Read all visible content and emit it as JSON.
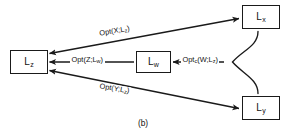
{
  "figure": {
    "caption": "(b)",
    "width": 286,
    "height": 131,
    "ink_color": "#1a1a1a",
    "background_color": "#ffffff"
  },
  "nodes": [
    {
      "id": "Lz",
      "base": "L",
      "sub": "z",
      "x": 10,
      "y": 50,
      "w": 38,
      "h": 24
    },
    {
      "id": "Lw",
      "base": "L",
      "sub": "w",
      "x": 136,
      "y": 51,
      "w": 35,
      "h": 22
    },
    {
      "id": "Lx",
      "base": "L",
      "sub": "x",
      "x": 242,
      "y": 5,
      "w": 38,
      "h": 24
    },
    {
      "id": "Ly",
      "base": "L",
      "sub": "y",
      "x": 242,
      "y": 96,
      "w": 38,
      "h": 24
    }
  ],
  "edge_labels": [
    {
      "id": "opt-x-lz",
      "prefix": "Opt",
      "csub": "",
      "args": "(X;L",
      "argsub": "z",
      "close": ")",
      "x": 98,
      "y": 30,
      "rotate": "up"
    },
    {
      "id": "opt-z-lw",
      "prefix": "Opt",
      "csub": "",
      "args": "(Z;L",
      "argsub": "w",
      "close": ")",
      "x": 70,
      "y": 56,
      "rotate": "none"
    },
    {
      "id": "opt-c-w-lz",
      "prefix": "Opt",
      "csub": "c",
      "args": "(W;L",
      "argsub": "z",
      "close": ")",
      "x": 181,
      "y": 56,
      "rotate": "none"
    },
    {
      "id": "opt-y-lz",
      "prefix": "Opt",
      "csub": "",
      "args": "(Y;L",
      "argsub": "z",
      "close": ")",
      "x": 98,
      "y": 82,
      "rotate": "down"
    }
  ],
  "edges": [
    {
      "id": "lz-lx-upper",
      "from": "Lz",
      "to": "Lx",
      "arrow_head": "both",
      "style": "straight"
    },
    {
      "id": "lz-ly-lower",
      "from": "Lz",
      "to": "Ly",
      "arrow_head": "both",
      "style": "straight"
    },
    {
      "id": "lw-lz-middle",
      "from": "Lw",
      "to": "Lz",
      "arrow_head": "target",
      "style": "straight"
    },
    {
      "id": "brace-lz-lw",
      "from": "brace",
      "to": "Lw",
      "arrow_head": "target",
      "style": "straight"
    },
    {
      "id": "brace-right",
      "from": "Lx",
      "to": "Ly",
      "arrow_head": "none",
      "style": "curly-brace"
    }
  ]
}
